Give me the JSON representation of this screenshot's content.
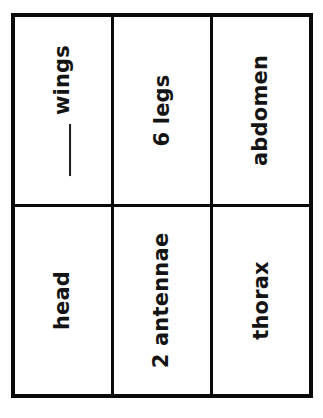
{
  "worksheet": {
    "background_color": "#ffffff",
    "border_color": "#0a0a0a",
    "text_color": "#141414",
    "text_orientation": "rotated-90-ccw",
    "rows": 2,
    "columns": 3,
    "cells": [
      {
        "id": "wings",
        "row": 0,
        "column": 0,
        "label": "wings",
        "has_blank_line": true,
        "blank_prefix": "____"
      },
      {
        "id": "legs",
        "row": 0,
        "column": 1,
        "label": "6 legs",
        "has_blank_line": false
      },
      {
        "id": "abdomen",
        "row": 0,
        "column": 2,
        "label": "abdomen",
        "has_blank_line": false
      },
      {
        "id": "head",
        "row": 1,
        "column": 0,
        "label": "head",
        "has_blank_line": false
      },
      {
        "id": "antennae",
        "row": 1,
        "column": 1,
        "label": "2 antennae",
        "has_blank_line": false
      },
      {
        "id": "thorax",
        "row": 1,
        "column": 2,
        "label": "thorax",
        "has_blank_line": false
      }
    ]
  }
}
